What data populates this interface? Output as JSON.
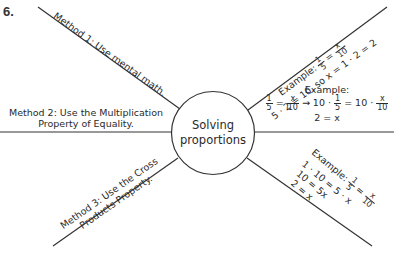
{
  "problem_number": "6.",
  "center": {
    "line1": "Solving",
    "line2": "proportions"
  },
  "branches": {
    "method1": "Method 1: Use mental math.",
    "method2": {
      "line1": "Method 2: Use the Multiplication",
      "line2": "Property of Equality."
    },
    "method3": {
      "line1": "Method 3: Use the Cross",
      "line2": "Products Property."
    },
    "example1": {
      "label": "Example:",
      "eq_lhs_num": "1",
      "eq_lhs_den": "5",
      "eq_rhs_num": "x",
      "eq_rhs_den": "10",
      "line2": "5 · 2 = 10, so x = 1 · 2 = 2"
    },
    "example2": {
      "label": "Example:",
      "f1_num": "1",
      "f1_den": "5",
      "eq": "=",
      "f2_num": "x",
      "f2_den": "10",
      "arrow": "→ 10 ·",
      "f3_num": "1",
      "f3_den": "5",
      "mid": "= 10 ·",
      "f4_num": "x",
      "f4_den": "10",
      "result": "2 = x"
    },
    "example3": {
      "label": "Example:",
      "f1_num": "1",
      "f1_den": "5",
      "eq": "=",
      "f2_num": "x",
      "f2_den": "10",
      "line2": "1 · 10 = 5 · x",
      "line3": "10 = 5x",
      "line4": "2 = x"
    }
  },
  "colors": {
    "line": "#333333",
    "text": "#2a2a2a",
    "background": "#ffffff"
  }
}
